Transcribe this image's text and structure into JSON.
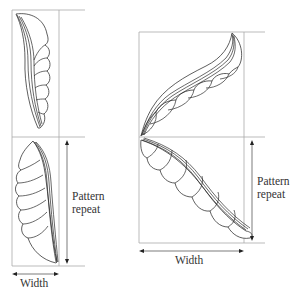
{
  "figure": {
    "left_motif": {
      "height_label_line1": "Pattern",
      "height_label_line2": "repeat",
      "width_label": "Width"
    },
    "right_motif": {
      "height_label_line1": "Pattern",
      "height_label_line2": "repeat",
      "width_label": "Width"
    },
    "colors": {
      "guide_lines": "#a9a9a9",
      "outline": "#2a2a2a",
      "text": "#333333"
    }
  }
}
